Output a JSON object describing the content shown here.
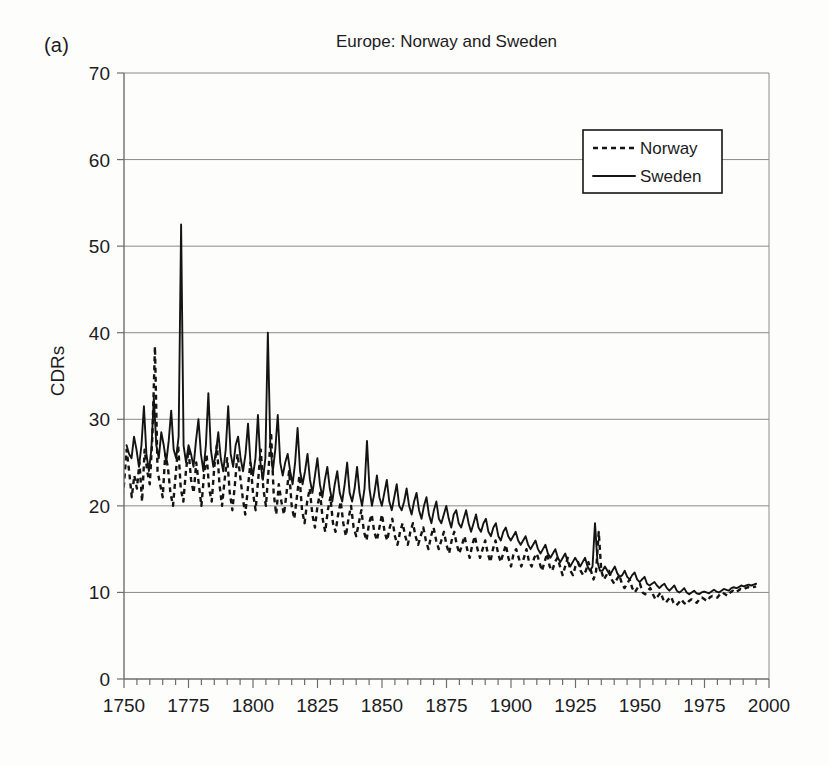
{
  "panel": {
    "label": "(a)"
  },
  "axis_title_y": "CDRs",
  "legend": {
    "position": "top-right-inside",
    "items": [
      {
        "name": "Norway",
        "style": "dashed"
      },
      {
        "name": "Sweden",
        "style": "solid"
      }
    ]
  },
  "chart_data": {
    "type": "line",
    "title": "Europe: Norway and Sweden",
    "xlabel": "",
    "ylabel": "CDRs",
    "xlim": [
      1750,
      2000
    ],
    "ylim": [
      0,
      70
    ],
    "xticks": [
      1750,
      1775,
      1800,
      1825,
      1850,
      1875,
      1900,
      1925,
      1950,
      1975,
      2000
    ],
    "yticks": [
      0,
      10,
      20,
      30,
      40,
      50,
      60,
      70
    ],
    "minor_xtick_step": 5,
    "grid": "horizontal",
    "series": [
      {
        "name": "Norway",
        "style": "dashed",
        "color": "#141414",
        "x_start": 1735,
        "x_end": 1995,
        "values": [
          22.0,
          24.5,
          21.5,
          23.0,
          25.5,
          22.5,
          21.0,
          23.5,
          26.0,
          22.0,
          20.5,
          23.0,
          25.5,
          21.5,
          20.0,
          22.5,
          26.5,
          24.0,
          21.0,
          23.5,
          22.0,
          25.0,
          20.5,
          26.5,
          24.0,
          22.5,
          28.0,
          38.4,
          24.0,
          22.5,
          21.0,
          26.0,
          24.5,
          21.5,
          20.0,
          23.5,
          27.0,
          22.0,
          20.5,
          24.0,
          26.5,
          23.0,
          21.5,
          25.0,
          22.5,
          20.0,
          23.5,
          26.0,
          22.0,
          20.5,
          24.5,
          27.0,
          22.5,
          20.0,
          23.0,
          25.5,
          21.5,
          19.5,
          22.5,
          26.0,
          23.5,
          21.0,
          19.0,
          22.0,
          25.0,
          21.5,
          19.5,
          23.0,
          26.5,
          22.0,
          20.0,
          24.0,
          28.5,
          21.5,
          19.0,
          22.5,
          20.5,
          19.0,
          21.5,
          24.0,
          20.0,
          18.5,
          21.0,
          23.5,
          19.5,
          18.0,
          20.5,
          22.0,
          19.0,
          17.5,
          20.0,
          21.5,
          18.5,
          17.0,
          19.5,
          21.0,
          18.0,
          17.0,
          19.0,
          20.5,
          18.0,
          16.5,
          18.5,
          20.0,
          17.5,
          16.5,
          18.0,
          19.5,
          17.0,
          16.0,
          18.0,
          19.0,
          17.0,
          16.0,
          17.5,
          19.0,
          17.0,
          16.0,
          17.5,
          18.5,
          16.5,
          15.5,
          17.0,
          18.0,
          16.5,
          15.5,
          17.0,
          18.0,
          16.5,
          15.5,
          16.5,
          17.5,
          16.0,
          15.0,
          16.5,
          17.5,
          16.0,
          15.0,
          16.0,
          17.0,
          15.5,
          14.5,
          16.0,
          17.0,
          15.5,
          14.5,
          15.5,
          16.5,
          15.0,
          14.0,
          15.5,
          16.5,
          15.0,
          14.0,
          15.0,
          16.0,
          14.5,
          13.5,
          15.0,
          16.0,
          14.5,
          13.5,
          14.5,
          15.5,
          14.0,
          13.0,
          14.5,
          15.0,
          14.0,
          13.0,
          14.0,
          15.0,
          13.5,
          13.0,
          14.0,
          14.5,
          13.5,
          12.5,
          13.5,
          14.5,
          13.0,
          12.5,
          13.5,
          14.0,
          13.0,
          12.0,
          13.0,
          14.0,
          12.5,
          12.0,
          13.0,
          13.5,
          12.5,
          12.0,
          12.5,
          13.5,
          12.5,
          11.5,
          12.5,
          17.0,
          12.5,
          11.5,
          12.0,
          12.5,
          11.5,
          11.0,
          11.5,
          12.0,
          11.0,
          10.5,
          11.0,
          11.5,
          10.5,
          10.0,
          10.5,
          11.0,
          10.0,
          9.8,
          10.2,
          10.5,
          9.8,
          9.2,
          9.6,
          10.0,
          9.2,
          8.8,
          9.2,
          9.5,
          8.8,
          8.5,
          8.8,
          9.2,
          8.8,
          8.6,
          9.0,
          9.2,
          9.0,
          8.8,
          9.2,
          9.4,
          9.2,
          9.0,
          9.4,
          9.6,
          9.5,
          9.4,
          9.8,
          10.0,
          9.8,
          9.6,
          10.0,
          10.2,
          10.0,
          10.2,
          10.4,
          10.3,
          10.5,
          10.6,
          10.5,
          10.6,
          10.7
        ]
      },
      {
        "name": "Sweden",
        "style": "solid",
        "color": "#141414",
        "x_start": 1751,
        "x_end": 1995,
        "values": [
          27.0,
          26.0,
          25.5,
          28.0,
          26.5,
          24.5,
          27.0,
          31.5,
          26.0,
          24.0,
          26.5,
          32.5,
          27.0,
          25.5,
          28.5,
          27.0,
          25.0,
          27.5,
          31.0,
          26.5,
          25.5,
          28.0,
          52.5,
          27.0,
          25.0,
          27.0,
          26.0,
          24.5,
          27.5,
          30.0,
          26.0,
          24.0,
          27.0,
          33.0,
          26.5,
          24.5,
          26.0,
          28.5,
          25.5,
          24.0,
          26.5,
          31.5,
          26.0,
          24.5,
          27.0,
          28.0,
          25.5,
          24.0,
          26.0,
          29.5,
          25.0,
          23.5,
          25.5,
          30.5,
          25.0,
          23.0,
          25.5,
          40.0,
          27.0,
          24.0,
          26.5,
          30.5,
          25.0,
          23.5,
          25.0,
          26.0,
          24.0,
          22.5,
          25.0,
          29.0,
          24.0,
          22.5,
          24.0,
          26.0,
          23.0,
          21.5,
          23.5,
          25.5,
          22.5,
          21.0,
          23.0,
          24.5,
          22.0,
          20.5,
          22.5,
          24.0,
          21.5,
          20.5,
          22.5,
          25.0,
          21.5,
          20.5,
          22.0,
          24.5,
          21.5,
          20.0,
          22.0,
          27.5,
          22.0,
          20.0,
          21.5,
          23.5,
          21.0,
          20.0,
          21.5,
          23.0,
          20.5,
          19.5,
          21.0,
          22.5,
          20.0,
          19.5,
          20.5,
          22.0,
          20.0,
          19.0,
          20.5,
          21.5,
          19.5,
          18.5,
          20.0,
          21.0,
          19.0,
          18.0,
          19.5,
          20.5,
          18.5,
          18.0,
          19.0,
          20.0,
          18.5,
          17.5,
          19.0,
          19.5,
          18.0,
          17.5,
          18.5,
          19.5,
          18.0,
          17.0,
          18.0,
          19.0,
          17.5,
          17.0,
          18.0,
          18.5,
          17.0,
          16.5,
          17.5,
          18.0,
          16.5,
          16.0,
          17.0,
          17.5,
          16.5,
          16.0,
          16.5,
          17.0,
          16.0,
          15.5,
          16.0,
          16.5,
          15.5,
          15.0,
          15.5,
          16.0,
          15.0,
          14.5,
          15.0,
          15.5,
          14.5,
          14.0,
          14.5,
          15.0,
          14.0,
          13.5,
          14.0,
          14.5,
          13.5,
          13.0,
          13.5,
          14.0,
          13.5,
          13.0,
          13.5,
          14.0,
          13.0,
          12.5,
          13.0,
          18.0,
          13.5,
          12.5,
          12.5,
          13.0,
          12.5,
          12.0,
          12.5,
          13.0,
          12.2,
          11.8,
          12.0,
          12.5,
          11.8,
          11.5,
          12.0,
          12.3,
          11.5,
          11.2,
          11.5,
          11.8,
          11.0,
          10.8,
          11.0,
          11.2,
          10.8,
          10.5,
          10.8,
          11.0,
          10.5,
          10.2,
          10.5,
          10.8,
          10.2,
          10.0,
          10.2,
          10.5,
          10.0,
          9.8,
          10.0,
          10.2,
          9.9,
          9.8,
          10.0,
          10.1,
          10.0,
          9.9,
          10.1,
          10.3,
          10.1,
          10.0,
          10.2,
          10.4,
          10.3,
          10.2,
          10.5,
          10.6,
          10.5,
          10.6,
          10.8,
          10.7,
          10.8,
          10.9,
          10.8,
          10.9,
          11.0
        ]
      }
    ]
  }
}
